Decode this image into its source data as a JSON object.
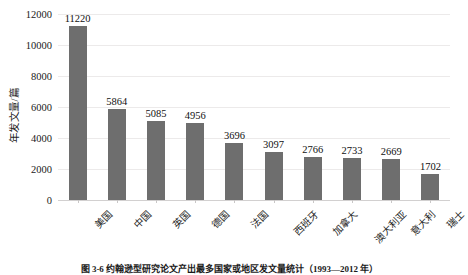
{
  "chart_data": {
    "type": "bar",
    "title": "",
    "xlabel": "",
    "ylabel": "年发文量/篇",
    "categories": [
      "美国",
      "中国",
      "英国",
      "德国",
      "法国",
      "西班牙",
      "加拿大",
      "澳大利亚",
      "意大利",
      "瑞士"
    ],
    "values": [
      11220,
      5864,
      5085,
      4956,
      3696,
      3097,
      2766,
      2733,
      2669,
      1702
    ],
    "value_labels": [
      "11220",
      "5864",
      "5085",
      "4956",
      "3696",
      "3097",
      "2766",
      "2733",
      "2669",
      "1702"
    ],
    "ylim": [
      0,
      12000
    ],
    "yticks": [
      0,
      2000,
      4000,
      6000,
      8000,
      10000,
      12000
    ],
    "ytick_labels": [
      "0",
      "2000",
      "4000",
      "6000",
      "8000",
      "10000",
      "12000"
    ],
    "grid": true,
    "legend": "none",
    "bar_color": "#6e6e6e",
    "grid_color": "#eceaea",
    "axis_color": "#d2d0d0"
  },
  "caption": {
    "text": "图 3-6  约翰逊型研究论文产出最多国家或地区发文量统计（1993—2012 年）"
  }
}
